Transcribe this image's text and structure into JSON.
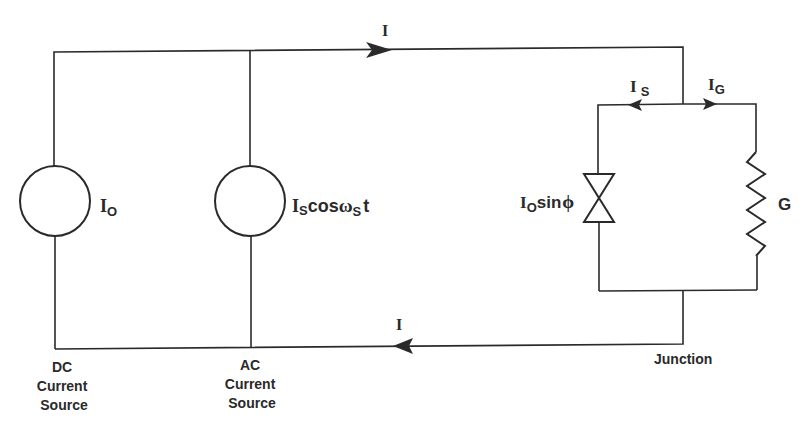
{
  "diagram": {
    "type": "circuit",
    "labels": {
      "top_current": "I",
      "bottom_current": "I",
      "dc_source_value": "I",
      "dc_source_sub": "O",
      "ac_source_I": "I",
      "ac_source_sub1": "S",
      "ac_source_cos": "cos",
      "ac_source_omega": "ω",
      "ac_source_sub2": "S",
      "ac_source_t": "t",
      "is_I": "I",
      "is_sub": "S",
      "ig_I": "I",
      "ig_sub": "G",
      "jj_I": "I",
      "jj_sub": "O",
      "jj_sin": "sin",
      "jj_phi": "ϕ",
      "resistor": "G",
      "dc_caption": [
        "DC",
        "Current",
        "Source"
      ],
      "ac_caption": [
        "AC",
        "Current",
        "Source"
      ],
      "junction_caption": "Junction"
    },
    "components": [
      {
        "name": "DC current source",
        "value": "I_O"
      },
      {
        "name": "AC current source",
        "value": "I_S cos ω_S t"
      },
      {
        "name": "Josephson junction",
        "value": "I_O sin ϕ"
      },
      {
        "name": "Conductance",
        "value": "G"
      }
    ],
    "colors": {
      "line": "#2a2a2a",
      "background": "#ffffff"
    }
  }
}
